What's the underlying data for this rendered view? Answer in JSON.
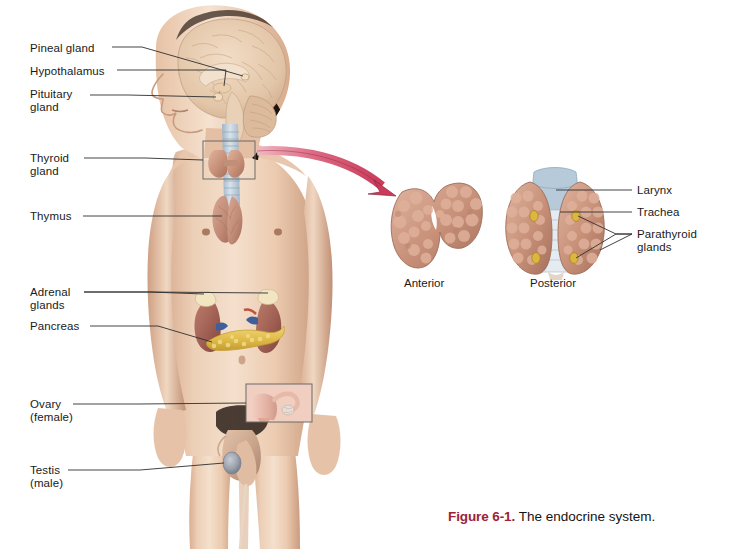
{
  "figure": {
    "number_label": "Figure 6-1.",
    "caption_text": "The endocrine system.",
    "accent_color": "#9b2335"
  },
  "left_labels": [
    {
      "id": "pineal-gland",
      "lines": [
        "Pineal gland"
      ]
    },
    {
      "id": "hypothalamus",
      "lines": [
        "Hypothalamus"
      ]
    },
    {
      "id": "pituitary-gland",
      "lines": [
        "Pituitary",
        "gland"
      ]
    },
    {
      "id": "thyroid-gland",
      "lines": [
        "Thyroid",
        "gland"
      ]
    },
    {
      "id": "thymus",
      "lines": [
        "Thymus"
      ]
    },
    {
      "id": "adrenal-glands",
      "lines": [
        "Adrenal",
        "glands"
      ]
    },
    {
      "id": "pancreas",
      "lines": [
        "Pancreas"
      ]
    },
    {
      "id": "ovary",
      "lines": [
        "Ovary",
        "(female)"
      ]
    },
    {
      "id": "testis",
      "lines": [
        "Testis",
        "(male)"
      ]
    }
  ],
  "left_label_text": {
    "pineal_gland": "Pineal gland",
    "hypothalamus": "Hypothalamus",
    "pituitary_line1": "Pituitary",
    "pituitary_line2": "gland",
    "thyroid_line1": "Thyroid",
    "thyroid_line2": "gland",
    "thymus": "Thymus",
    "adrenal_line1": "Adrenal",
    "adrenal_line2": "glands",
    "pancreas": "Pancreas",
    "ovary_line1": "Ovary",
    "ovary_line2": "(female)",
    "testis_line1": "Testis",
    "testis_line2": "(male)"
  },
  "right_label_text": {
    "larynx": "Larynx",
    "trachea": "Trachea",
    "parathyroid_line1": "Parathyroid",
    "parathyroid_line2": "glands"
  },
  "view_captions": {
    "anterior": "Anterior",
    "posterior": "Posterior"
  },
  "colors": {
    "skin_light": "#f2d8c4",
    "skin_mid": "#e8c3a8",
    "skin_shadow": "#cfa387",
    "hair_dark": "#241a15",
    "brain_tan": "#e8cdb2",
    "thyroid_pink": "#d4a08c",
    "thyroid_pink_dark": "#b07f6b",
    "trachea_blue": "#b9c9d8",
    "larynx_blue": "#a8bdd0",
    "kidney_brown": "#a8685c",
    "pancreas_yellow": "#e6c257",
    "adrenal_cream": "#f0e2bd",
    "parathyroid_yellow": "#d9b63c",
    "arrow_pink": "#d9556e",
    "leader_line": "#3a3a3a",
    "box_outline": "#6b6b6b",
    "caption_accent": "#9b2335",
    "text": "#1a1a1a"
  }
}
